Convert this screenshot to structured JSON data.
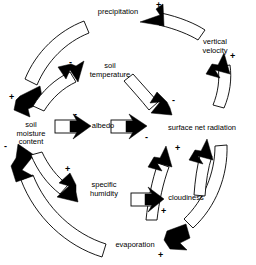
{
  "diagram": {
    "type": "causal-loop-diagram",
    "background_color": "#ffffff",
    "line_color": "#000000",
    "nodes": [
      {
        "id": "precipitation",
        "label": "precipitation",
        "x": 118,
        "y": 12,
        "align": "center"
      },
      {
        "id": "vertical_velocity",
        "label": "vertical\nvelocity",
        "x": 215,
        "y": 42,
        "align": "center"
      },
      {
        "id": "soil_temperature",
        "label": "soil\ntemperature",
        "x": 110,
        "y": 66,
        "align": "center"
      },
      {
        "id": "surface_net_radiation",
        "label": "surface net radiation",
        "x": 201,
        "y": 128,
        "align": "center"
      },
      {
        "id": "albedo",
        "label": "albedo",
        "x": 103,
        "y": 127,
        "align": "center"
      },
      {
        "id": "soil_moisture_content",
        "label": "soil\nmoisture\ncontent",
        "x": 31,
        "y": 133,
        "align": "center"
      },
      {
        "id": "specific_humidity",
        "label": "specific\nhumidity",
        "x": 104,
        "y": 186,
        "align": "center"
      },
      {
        "id": "cloudiness",
        "label": "cloudiness",
        "x": 186,
        "y": 199,
        "align": "center"
      },
      {
        "id": "evaporation",
        "label": "evaporation",
        "x": 135,
        "y": 246,
        "align": "center"
      }
    ],
    "links": [
      {
        "id": "precip-to-soilmoisture",
        "from": "precipitation",
        "to": "soil_moisture_content",
        "sign": "+",
        "shape": "outer-arc-left-top"
      },
      {
        "id": "soilmoisture-to-soiltemp",
        "from": "soil_moisture_content",
        "to": "soil_temperature",
        "sign": "-",
        "shape": "inner-arc-left-top"
      },
      {
        "id": "soiltemp-to-netradiation",
        "from": "soil_temperature",
        "to": "surface_net_radiation",
        "sign": "-",
        "shape": "short-arc-center"
      },
      {
        "id": "soilmoisture-to-albedo",
        "from": "soil_moisture_content",
        "to": "albedo",
        "sign": "-",
        "shape": "horizontal-bar"
      },
      {
        "id": "albedo-to-netradiation",
        "from": "albedo",
        "to": "surface_net_radiation",
        "sign": "-",
        "shape": "horizontal-bar"
      },
      {
        "id": "netradiation-to-vertvel",
        "from": "surface_net_radiation",
        "to": "vertical_velocity",
        "sign": "+",
        "shape": "outer-arc-right-top"
      },
      {
        "id": "vertvel-to-precip",
        "from": "vertical_velocity",
        "to": "precipitation",
        "sign": "+",
        "shape": "outer-arc-top"
      },
      {
        "id": "soilmoisture-to-spechum",
        "from": "soil_moisture_content",
        "to": "specific_humidity",
        "sign": "+",
        "shape": "inner-arc-left-bottom"
      },
      {
        "id": "evaporation-to-soilmoisture",
        "from": "evaporation",
        "to": "soil_moisture_content",
        "sign": "-",
        "shape": "outer-arc-left-bottom"
      },
      {
        "id": "evaporation-to-cloud-up",
        "from": "evaporation",
        "to": "surface_net_radiation",
        "sign": "+",
        "shape": "inner-arc-right-bottom"
      },
      {
        "id": "netradiation-to-evaporation",
        "from": "surface_net_radiation",
        "to": "evaporation",
        "sign": "+",
        "shape": "outer-arc-right-bottom"
      },
      {
        "id": "spechum-to-cloudiness",
        "from": "specific_humidity",
        "to": "cloudiness",
        "sign": "+",
        "shape": "horizontal-bar"
      }
    ],
    "signs": [
      {
        "id": "sign-precip-plus",
        "text": "+",
        "x": 156,
        "y": 2
      },
      {
        "id": "sign-vertvel-plus",
        "text": "+",
        "x": 230,
        "y": 56
      },
      {
        "id": "sign-soiltemp-minus",
        "text": "-",
        "x": 69,
        "y": 62
      },
      {
        "id": "sign-netrad-minus-top",
        "text": "-",
        "x": 172,
        "y": 98
      },
      {
        "id": "sign-albedo-minus-left",
        "text": "-",
        "x": 74,
        "y": 113
      },
      {
        "id": "sign-albedo-minus-right",
        "text": "-",
        "x": 145,
        "y": 136
      },
      {
        "id": "sign-soilmoist-plus",
        "text": "+",
        "x": 9,
        "y": 97
      },
      {
        "id": "sign-soilmoist-minus",
        "text": "-",
        "x": 5,
        "y": 146
      },
      {
        "id": "sign-spechum-plus",
        "text": "+",
        "x": 65,
        "y": 169
      },
      {
        "id": "sign-netrad-plus-low",
        "text": "+",
        "x": 175,
        "y": 148
      },
      {
        "id": "sign-cloud-plus",
        "text": "+",
        "x": 160,
        "y": 210
      },
      {
        "id": "sign-evap-plus",
        "text": "+",
        "x": 158,
        "y": 254
      }
    ]
  }
}
